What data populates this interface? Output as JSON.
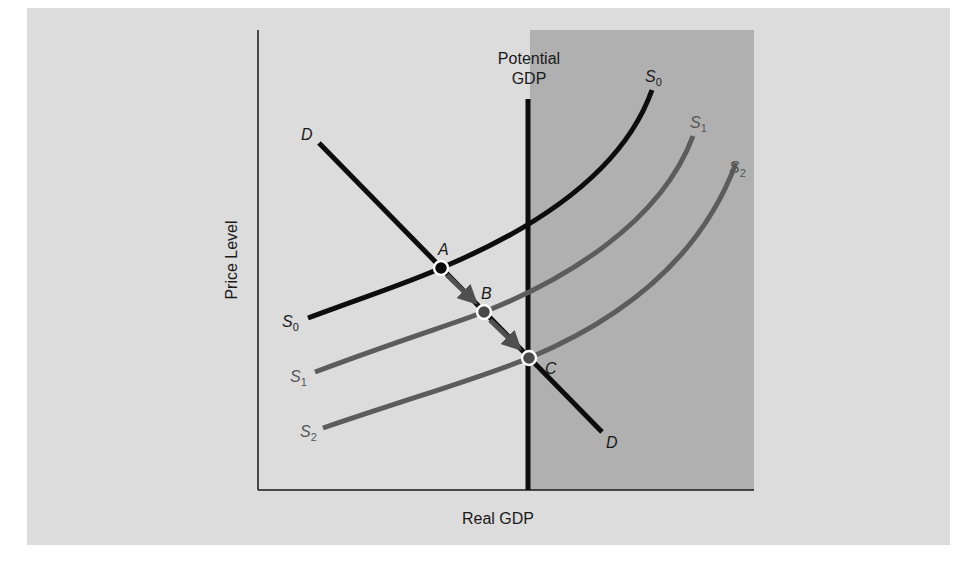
{
  "diagram": {
    "type": "aggregate-supply-demand",
    "colors": {
      "panel_bg": "#dcdcdc",
      "shaded_region": "#b0b0b0",
      "axis": "#1a1a1a",
      "demand_curve": "#0d0d0d",
      "supply_s0": "#0d0d0d",
      "supply_shifted": "#5c5c5c",
      "arrow": "#4f4f4f"
    },
    "axes": {
      "x_label": "Real GDP",
      "y_label": "Price Level"
    },
    "potential_gdp": {
      "label_line1": "Potential",
      "label_line2": "GDP"
    },
    "curves": {
      "demand": {
        "label_top": "D",
        "label_bottom": "D"
      },
      "s0": {
        "label_main": "S",
        "label_sub": "0"
      },
      "s1": {
        "label_main": "S",
        "label_sub": "1"
      },
      "s2": {
        "label_main": "S",
        "label_sub": "2"
      }
    },
    "points": [
      {
        "label": "A"
      },
      {
        "label": "B"
      },
      {
        "label": "C"
      }
    ]
  }
}
